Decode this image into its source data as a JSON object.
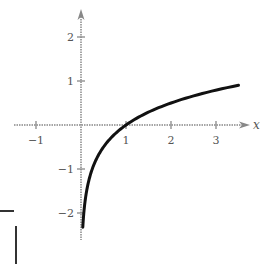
{
  "chart_data": {
    "type": "line",
    "title": "",
    "xlabel": "x",
    "ylabel": "",
    "xlim": [
      -1.5,
      3.7
    ],
    "ylim": [
      -2.5,
      2.6
    ],
    "grid": false,
    "legend": null,
    "x_ticks": [
      -1,
      1,
      2,
      3
    ],
    "x_tick_labels": [
      "−1",
      "1",
      "2",
      "3"
    ],
    "y_ticks": [
      2,
      1,
      -1,
      -2
    ],
    "y_tick_labels": [
      "2",
      "1",
      "−1",
      "−2"
    ],
    "series": [
      {
        "name": "curve",
        "description": "logarithmic curve passing through (1, 0)",
        "x": [
          0.04,
          0.1,
          0.2,
          0.3,
          0.5,
          0.75,
          1.0,
          1.5,
          2.0,
          2.5,
          3.0,
          3.5
        ],
        "y": [
          -2.32,
          -1.66,
          -1.16,
          -0.87,
          -0.5,
          -0.21,
          0.0,
          0.29,
          0.5,
          0.66,
          0.79,
          0.9
        ]
      }
    ]
  },
  "colors": {
    "axis": "#888888",
    "curve": "#111111",
    "text": "#555555",
    "background": "#ffffff"
  }
}
